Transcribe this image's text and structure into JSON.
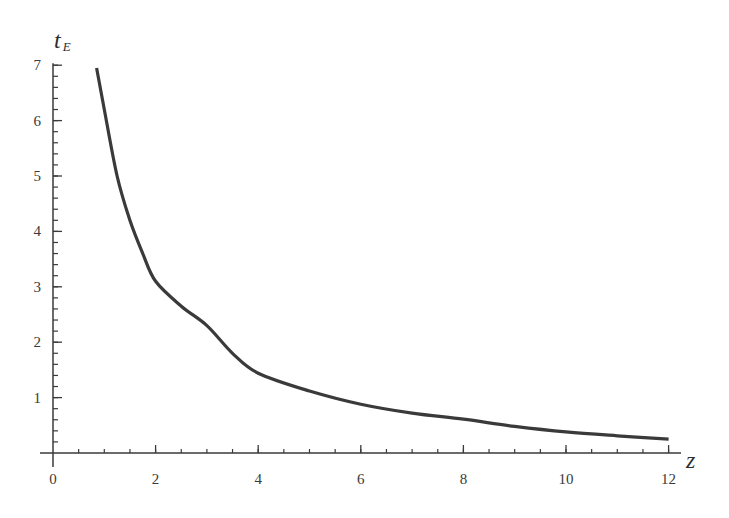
{
  "chart_data": {
    "type": "line",
    "title": "",
    "xlabel": "z",
    "ylabel": "t",
    "ylabel_subscript": "E",
    "xlim": [
      0,
      12.5
    ],
    "ylim": [
      0,
      7
    ],
    "x_ticks": [
      0,
      2,
      4,
      6,
      8,
      10,
      12
    ],
    "x_tick_labels": [
      "0",
      "2",
      "4",
      "6",
      "8",
      "10",
      "12"
    ],
    "x_minor_step": 0.5,
    "y_ticks": [
      1,
      2,
      3,
      4,
      5,
      6,
      7
    ],
    "y_tick_labels": [
      "1",
      "2",
      "3",
      "4",
      "5",
      "6",
      "7"
    ],
    "y_minor_step": 0.2,
    "grid": false,
    "legend": null,
    "series": [
      {
        "name": "t_E(z)",
        "color": "#3a3a3a",
        "x": [
          0.85,
          1.0,
          1.25,
          1.5,
          1.75,
          2.0,
          2.5,
          3.0,
          3.5,
          4.0,
          5.0,
          6.0,
          7.0,
          8.0,
          9.0,
          10.0,
          11.0,
          12.0
        ],
        "y": [
          6.95,
          6.2,
          5.0,
          4.2,
          3.6,
          3.1,
          2.65,
          2.3,
          1.8,
          1.44,
          1.12,
          0.88,
          0.72,
          0.61,
          0.48,
          0.38,
          0.31,
          0.25
        ]
      }
    ]
  }
}
